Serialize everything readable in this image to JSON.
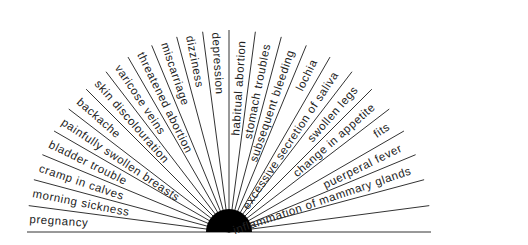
{
  "diagram": {
    "type": "radial-fan",
    "angle_step_degrees": 7.5,
    "line_count": 25,
    "hub_color": "#000000",
    "line_color": "#333333",
    "labels": [
      "pregnancy",
      "morning sickness",
      "cramp in calves",
      "bladder trouble",
      "painfully swollen breasts",
      "backache",
      "skin discolouration",
      "varicose veins",
      "threatened abortion",
      "miscarriage",
      "dizziness",
      "depression",
      "habitual abortion",
      "stomach troubles",
      "subsequent bleeding",
      "lochia",
      "excessive secretion of saliva",
      "swollen legs",
      "change in appetite",
      "fits",
      "puerperal fever",
      "inflammation of mammary glands"
    ]
  }
}
